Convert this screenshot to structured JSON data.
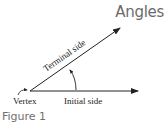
{
  "title": "Angles",
  "figure_label": "Figure 1",
  "diagram": {
    "labels": {
      "terminal_side": "Terminal side",
      "initial_side": "Initial side",
      "vertex": "Vertex"
    },
    "colors": {
      "line": "#222222",
      "title": "#6b6b6b",
      "caption": "#707070"
    }
  }
}
